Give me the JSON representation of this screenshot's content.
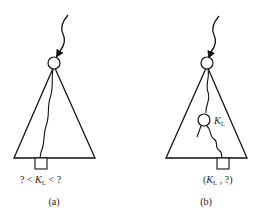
{
  "diagrams": [
    {
      "id": "a",
      "caption": "(a)",
      "leaf_label": {
        "prefix": "? < ",
        "key": "K",
        "key_sub": "L",
        "suffix": " < ?"
      }
    },
    {
      "id": "b",
      "caption": "(b)",
      "node_label": {
        "key": "K",
        "key_sub": "L"
      },
      "leaf_label": {
        "prefix": "(",
        "key": "K",
        "key_sub": "L",
        "suffix": " , ?)"
      }
    }
  ],
  "colors": {
    "stroke": "#111111",
    "background": "#ffffff"
  }
}
